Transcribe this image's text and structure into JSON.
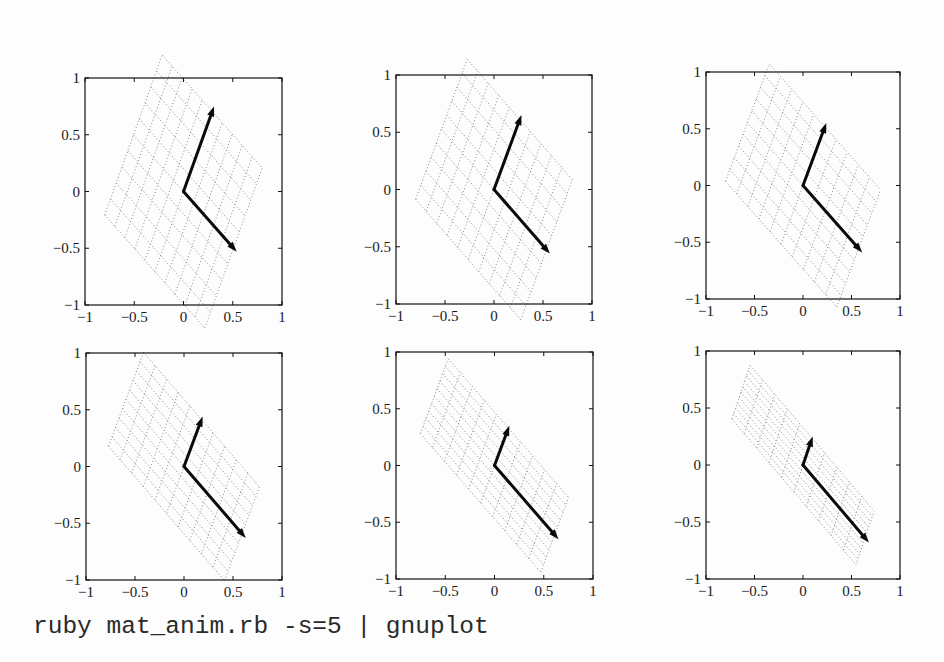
{
  "caption": "ruby mat_anim.rb -s=5 | gnuplot",
  "colors": {
    "axes": "#111111",
    "vectors": "#0a0a0a",
    "lattice": "#8a8a8a",
    "background": "#fdfdfd"
  },
  "chart_data": [
    {
      "type": "line",
      "panel": 1,
      "title": "",
      "xlabel": "",
      "ylabel": "",
      "xlim": [
        -1,
        1
      ],
      "ylim": [
        -1,
        1
      ],
      "grid": false,
      "xticks": [
        -1,
        -0.5,
        0,
        0.5,
        1
      ],
      "xticklabels": [
        "−1",
        "−0.5",
        "0",
        "0.5",
        "1"
      ],
      "yticks": [
        -1,
        -0.5,
        0,
        0.5,
        1
      ],
      "yticklabels": [
        "−1",
        "−0.5",
        "0",
        "0.5",
        "1"
      ],
      "vectors": [
        {
          "name": "vector-a",
          "from": [
            0,
            0
          ],
          "to": [
            0.54,
            -0.53
          ]
        },
        {
          "name": "vector-b",
          "from": [
            0,
            0
          ],
          "to": [
            0.31,
            0.75
          ]
        }
      ],
      "lattice": {
        "style": "dotted",
        "divisions": 10,
        "span": [
          -0.94,
          0.94
        ]
      }
    },
    {
      "type": "line",
      "panel": 2,
      "title": "",
      "xlabel": "",
      "ylabel": "",
      "xlim": [
        -1,
        1
      ],
      "ylim": [
        -1,
        1
      ],
      "grid": false,
      "xticks": [
        -1,
        -0.5,
        0,
        0.5,
        1
      ],
      "xticklabels": [
        "−1",
        "−0.5",
        "0",
        "0.5",
        "1"
      ],
      "yticks": [
        -1,
        -0.5,
        0,
        0.5,
        1
      ],
      "yticklabels": [
        "−1",
        "−0.5",
        "0",
        "0.5",
        "1"
      ],
      "vectors": [
        {
          "name": "vector-a",
          "from": [
            0,
            0
          ],
          "to": [
            0.57,
            -0.56
          ]
        },
        {
          "name": "vector-b",
          "from": [
            0,
            0
          ],
          "to": [
            0.28,
            0.65
          ]
        }
      ],
      "lattice": {
        "style": "dotted",
        "divisions": 10,
        "span": [
          -0.94,
          0.94
        ]
      }
    },
    {
      "type": "line",
      "panel": 3,
      "title": "",
      "xlabel": "",
      "ylabel": "",
      "xlim": [
        -1,
        1
      ],
      "ylim": [
        -1,
        1
      ],
      "grid": false,
      "xticks": [
        -1,
        -0.5,
        0,
        0.5,
        1
      ],
      "xticklabels": [
        "−1",
        "−0.5",
        "0",
        "0.5",
        "1"
      ],
      "yticks": [
        -1,
        -0.5,
        0,
        0.5,
        1
      ],
      "yticklabels": [
        "−1",
        "−0.5",
        "0",
        "0.5",
        "1"
      ],
      "vectors": [
        {
          "name": "vector-a",
          "from": [
            0,
            0
          ],
          "to": [
            0.61,
            -0.59
          ]
        },
        {
          "name": "vector-b",
          "from": [
            0,
            0
          ],
          "to": [
            0.24,
            0.55
          ]
        }
      ],
      "lattice": {
        "style": "dotted",
        "divisions": 10,
        "span": [
          -0.94,
          0.94
        ]
      }
    },
    {
      "type": "line",
      "panel": 4,
      "title": "",
      "xlabel": "",
      "ylabel": "",
      "xlim": [
        -1,
        1
      ],
      "ylim": [
        -1,
        1
      ],
      "grid": false,
      "xticks": [
        -1,
        -0.5,
        0,
        0.5,
        1
      ],
      "xticklabels": [
        "−1",
        "−0.5",
        "0",
        "0.5",
        "1"
      ],
      "yticks": [
        -1,
        -0.5,
        0,
        0.5,
        1
      ],
      "yticklabels": [
        "−1",
        "−0.5",
        "0",
        "0.5",
        "1"
      ],
      "vectors": [
        {
          "name": "vector-a",
          "from": [
            0,
            0
          ],
          "to": [
            0.63,
            -0.63
          ]
        },
        {
          "name": "vector-b",
          "from": [
            0,
            0
          ],
          "to": [
            0.19,
            0.44
          ]
        }
      ],
      "lattice": {
        "style": "dotted",
        "divisions": 10,
        "span": [
          -0.94,
          0.94
        ]
      }
    },
    {
      "type": "line",
      "panel": 5,
      "title": "",
      "xlabel": "",
      "ylabel": "",
      "xlim": [
        -1,
        1
      ],
      "ylim": [
        -1,
        1
      ],
      "grid": false,
      "xticks": [
        -1,
        -0.5,
        0,
        0.5,
        1
      ],
      "xticklabels": [
        "−1",
        "−0.5",
        "0",
        "0.5",
        "1"
      ],
      "yticks": [
        -1,
        -0.5,
        0,
        0.5,
        1
      ],
      "yticklabels": [
        "−1",
        "−0.5",
        "0",
        "0.5",
        "1"
      ],
      "vectors": [
        {
          "name": "vector-a",
          "from": [
            0,
            0
          ],
          "to": [
            0.65,
            -0.65
          ]
        },
        {
          "name": "vector-b",
          "from": [
            0,
            0
          ],
          "to": [
            0.15,
            0.35
          ]
        }
      ],
      "lattice": {
        "style": "dotted",
        "divisions": 10,
        "span": [
          -0.94,
          0.94
        ]
      }
    },
    {
      "type": "line",
      "panel": 6,
      "title": "",
      "xlabel": "",
      "ylabel": "",
      "xlim": [
        -1,
        1
      ],
      "ylim": [
        -1,
        1
      ],
      "grid": false,
      "xticks": [
        -1,
        -0.5,
        0,
        0.5,
        1
      ],
      "xticklabels": [
        "−1",
        "−0.5",
        "0",
        "0.5",
        "1"
      ],
      "yticks": [
        -1,
        -0.5,
        0,
        0.5,
        1
      ],
      "yticklabels": [
        "−1",
        "−0.5",
        "0",
        "0.5",
        "1"
      ],
      "vectors": [
        {
          "name": "vector-a",
          "from": [
            0,
            0
          ],
          "to": [
            0.68,
            -0.68
          ]
        },
        {
          "name": "vector-b",
          "from": [
            0,
            0
          ],
          "to": [
            0.1,
            0.25
          ]
        }
      ],
      "lattice": {
        "style": "dotted",
        "divisions": 10,
        "span": [
          -0.94,
          0.94
        ]
      }
    }
  ]
}
